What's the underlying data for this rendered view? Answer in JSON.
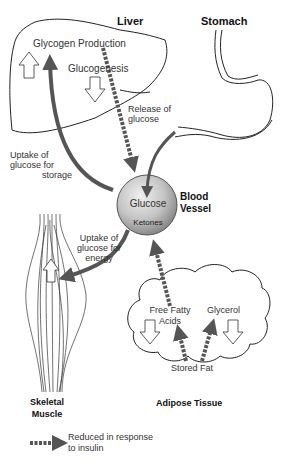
{
  "organs": {
    "liver": "Liver",
    "stomach": "Stomach",
    "blood_vessel_line1": "Blood",
    "blood_vessel_line2": "Vessel",
    "skeletal_muscle_line1": "Skeletal",
    "skeletal_muscle_line2": "Muscle",
    "adipose_tissue": "Adipose Tissue"
  },
  "processes": {
    "glycogen_production": "Glycogen Production",
    "glucogenesis": "Glucogenesis",
    "release_of_glucose_line1": "Release of",
    "release_of_glucose_line2": "glucose",
    "uptake_storage_line1": "Uptake of",
    "uptake_storage_line2": "glucose for",
    "uptake_storage_line3": "storage",
    "uptake_energy_line1": "Uptake of",
    "uptake_energy_line2": "glucose for",
    "uptake_energy_line3": "energy"
  },
  "blood": {
    "glucose": "Glucose",
    "ketones": "Ketones"
  },
  "adipose": {
    "free_fatty_acids_line1": "Free Fatty",
    "free_fatty_acids_line2": "Acids",
    "glycerol": "Glycerol",
    "stored_fat": "Stored Fat"
  },
  "legend": {
    "dashed_arrow_line1": "Reduced in response",
    "dashed_arrow_line2": "to insulin"
  },
  "colors": {
    "arrow": "#555555",
    "outline": "#222222",
    "sphere": "#b8b8b8"
  }
}
